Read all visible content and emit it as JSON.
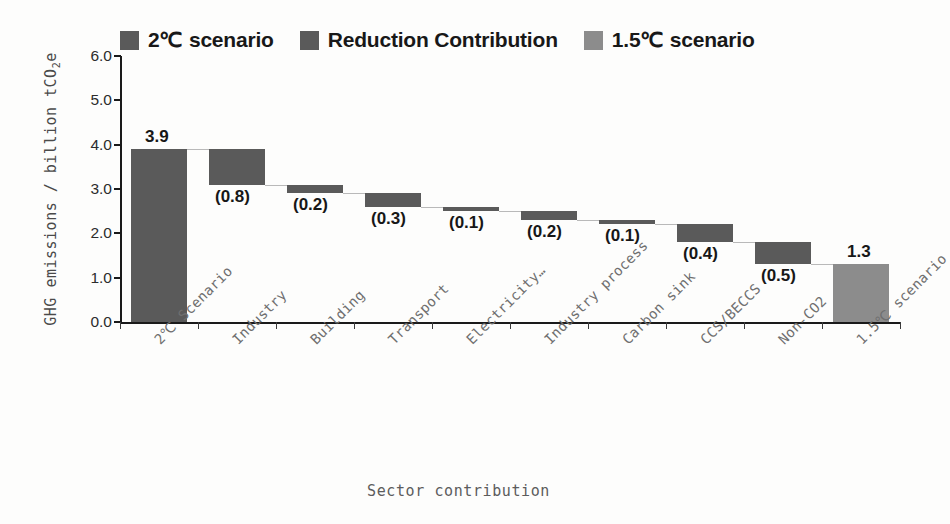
{
  "chart_data": {
    "type": "bar",
    "subtype": "waterfall",
    "title": "",
    "xlabel": "Sector contribution",
    "ylabel": "GHG emissions / billion tCO2e",
    "ylabel_html": "GHG emissions / billion tCO₂e",
    "ylim": [
      0.0,
      6.0
    ],
    "ytick_labels": [
      "0.0",
      "1.0",
      "2.0",
      "3.0",
      "4.0",
      "5.0",
      "6.0"
    ],
    "ytick_values": [
      0.0,
      1.0,
      2.0,
      3.0,
      4.0,
      5.0,
      6.0
    ],
    "grid": false,
    "legend_position": "top",
    "categories": [
      "2℃ Scenario",
      "Industry",
      "Building",
      "Transport",
      "Electricity…",
      "Industry process",
      "Carbon sink",
      "CCS/BECCS",
      "Non-CO2",
      "1.5℃ scenario"
    ],
    "series": [
      {
        "name": "2℃ scenario",
        "kind": "total",
        "color": "#5a5a5a",
        "values": [
          3.9,
          null,
          null,
          null,
          null,
          null,
          null,
          null,
          null,
          null
        ]
      },
      {
        "name": "Reduction Contribution",
        "kind": "delta",
        "color": "#5a5a5a",
        "values": [
          null,
          -0.8,
          -0.2,
          -0.3,
          -0.1,
          -0.2,
          -0.1,
          -0.4,
          -0.5,
          null
        ]
      },
      {
        "name": "1.5℃ scenario",
        "kind": "total",
        "color": "#8c8c8c",
        "values": [
          null,
          null,
          null,
          null,
          null,
          null,
          null,
          null,
          null,
          1.3
        ]
      }
    ],
    "bars": [
      {
        "category": "2℃ Scenario",
        "label": "3.9",
        "value": 3.9,
        "base": 0.0,
        "top": 3.9,
        "kind": "total",
        "label_pos": "above"
      },
      {
        "category": "Industry",
        "label": "(0.8)",
        "value": -0.8,
        "base": 3.1,
        "top": 3.9,
        "kind": "delta",
        "label_pos": "below"
      },
      {
        "category": "Building",
        "label": "(0.2)",
        "value": -0.2,
        "base": 2.9,
        "top": 3.1,
        "kind": "delta",
        "label_pos": "below"
      },
      {
        "category": "Transport",
        "label": "(0.3)",
        "value": -0.3,
        "base": 2.6,
        "top": 2.9,
        "kind": "delta",
        "label_pos": "below"
      },
      {
        "category": "Electricity…",
        "label": "(0.1)",
        "value": -0.1,
        "base": 2.5,
        "top": 2.6,
        "kind": "delta",
        "label_pos": "below"
      },
      {
        "category": "Industry process",
        "label": "(0.2)",
        "value": -0.2,
        "base": 2.3,
        "top": 2.5,
        "kind": "delta",
        "label_pos": "below"
      },
      {
        "category": "Carbon sink",
        "label": "(0.1)",
        "value": -0.1,
        "base": 2.2,
        "top": 2.3,
        "kind": "delta",
        "label_pos": "below"
      },
      {
        "category": "CCS/BECCS",
        "label": "(0.4)",
        "value": -0.4,
        "base": 1.8,
        "top": 2.2,
        "kind": "delta",
        "label_pos": "below"
      },
      {
        "category": "Non-CO2",
        "label": "(0.5)",
        "value": -0.5,
        "base": 1.3,
        "top": 1.8,
        "kind": "delta",
        "label_pos": "below"
      },
      {
        "category": "1.5℃ scenario",
        "label": "1.3",
        "value": 1.3,
        "base": 0.0,
        "top": 1.3,
        "kind": "final",
        "label_pos": "above"
      }
    ]
  },
  "legend": {
    "items": [
      {
        "label": "2℃ scenario",
        "color": "#5a5a5a"
      },
      {
        "label": "Reduction Contribution",
        "color": "#5a5a5a"
      },
      {
        "label": "1.5℃ scenario",
        "color": "#8c8c8c"
      }
    ]
  },
  "axes": {
    "x_title": "Sector contribution",
    "y_title": "GHG emissions / billion tCO",
    "y_title_sub": "2",
    "y_title_tail": "e"
  },
  "colors": {
    "bar_dark": "#5a5a5a",
    "bar_light": "#8c8c8c",
    "axis": "#1a1a1a",
    "connector": "#b9b9b9",
    "text": "#171717",
    "tick_text": "#2c2c2c",
    "cat_text": "#6f6f6f"
  }
}
